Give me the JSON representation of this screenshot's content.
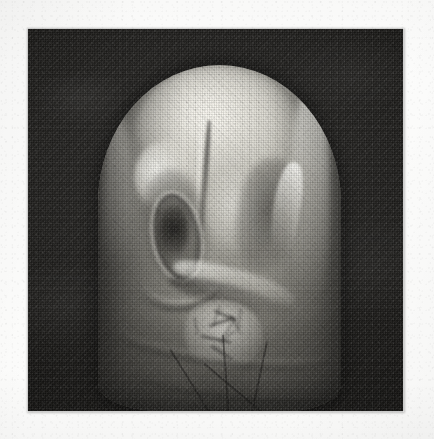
{
  "document": {
    "type": "scanned-halftone-photograph",
    "page_background": "#fdfdfc",
    "caption": ""
  },
  "plate": {
    "name": "monochrome-halftone-plate",
    "left": 28,
    "top": 29,
    "width": 375,
    "height": 382,
    "background_color": "#1b1b1a",
    "print_process": "halftone-dot-screen",
    "tone": "black-and-white"
  },
  "subject": {
    "description": "dome-shaped object on dark backdrop",
    "silhouette": "rounded-dome",
    "highlight_color": "#e8e6de",
    "midtone_color": "#b2b0a7",
    "shadow_color": "#6e6c65",
    "backdrop_color": "#232220",
    "features": [
      {
        "name": "crown-highlight",
        "tone": "bright"
      },
      {
        "name": "vertical-ridge",
        "tone": "bright"
      },
      {
        "name": "brow-highlight",
        "tone": "bright"
      },
      {
        "name": "eye-socket-recess",
        "tone": "dark"
      },
      {
        "name": "socket-ring",
        "tone": "bright"
      },
      {
        "name": "cheek-highlight",
        "tone": "bright"
      },
      {
        "name": "right-hollow",
        "tone": "dark"
      },
      {
        "name": "right-crescent-rimlight",
        "tone": "bright"
      },
      {
        "name": "ledge-band",
        "tone": "bright"
      },
      {
        "name": "crazed-crack-patch",
        "tone": "bright"
      },
      {
        "name": "lower-folds",
        "tone": "dark"
      }
    ]
  },
  "cracks": [
    {
      "x": 38,
      "y": 14,
      "len": 30,
      "rot": 24,
      "w": 1.6
    },
    {
      "x": 44,
      "y": 10,
      "len": 26,
      "rot": 108,
      "w": 1.4
    },
    {
      "x": 30,
      "y": 36,
      "len": 34,
      "rot": -18,
      "w": 1.5
    },
    {
      "x": 58,
      "y": 20,
      "len": 28,
      "rot": 64,
      "w": 1.4
    },
    {
      "x": 20,
      "y": 50,
      "len": 40,
      "rot": 12,
      "w": 1.6
    },
    {
      "x": 64,
      "y": 44,
      "len": 24,
      "rot": 142,
      "w": 1.3
    },
    {
      "x": 48,
      "y": 52,
      "len": 30,
      "rot": -56,
      "w": 1.4
    },
    {
      "x": 12,
      "y": 26,
      "len": 22,
      "rot": 78,
      "w": 1.3
    },
    {
      "x": 72,
      "y": 12,
      "len": 26,
      "rot": 96,
      "w": 1.4
    },
    {
      "x": 34,
      "y": 64,
      "len": 32,
      "rot": 34,
      "w": 1.5
    }
  ],
  "long_cracks": [
    {
      "x": 30,
      "y": 82,
      "len": 96,
      "rot": 58,
      "w": 1.7
    },
    {
      "x": 52,
      "y": 78,
      "len": 74,
      "rot": 86,
      "w": 1.6
    },
    {
      "x": 70,
      "y": 80,
      "len": 62,
      "rot": 102,
      "w": 1.5
    },
    {
      "x": 44,
      "y": 86,
      "len": 58,
      "rot": 40,
      "w": 1.5
    }
  ]
}
